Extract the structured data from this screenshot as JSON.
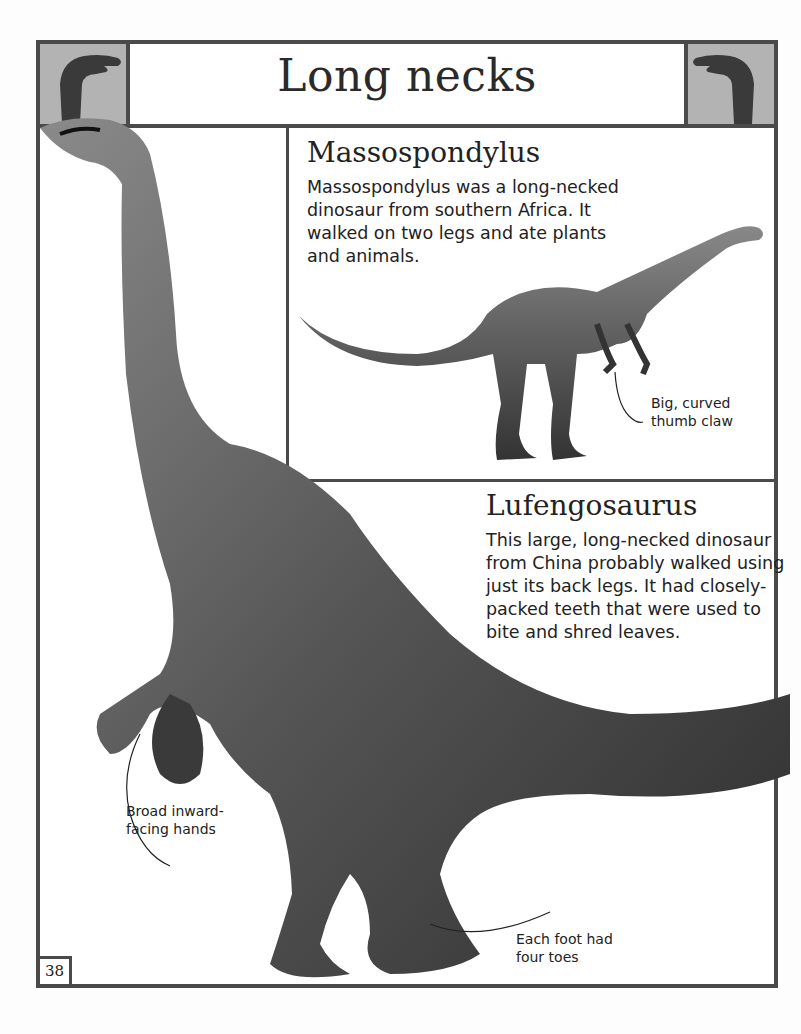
{
  "page": {
    "title": "Long necks",
    "page_number": "38",
    "header_icons": [
      "long-neck-dinosaur-silhouette-left",
      "long-neck-dinosaur-silhouette-right"
    ],
    "colors": {
      "frame": "#4a4a4a",
      "icon_box_bg": "#b3b3b3",
      "silhouette": "#3a3a3a",
      "text": "#222222"
    }
  },
  "sections": {
    "massospondylus": {
      "title": "Massospondylus",
      "text": "Massospondylus was a long-necked dinosaur from southern Africa. It walked on two legs and ate plants and animals.",
      "caption": "Big, curved thumb claw"
    },
    "lufengosaurus": {
      "title": "Lufengosaurus",
      "text": "This large, long-necked dinosaur from China probably walked using just its back legs. It had closely-packed teeth that were used to bite and shred leaves.",
      "captions": {
        "hands": "Broad inward-facing hands",
        "feet": "Each foot had four toes"
      }
    }
  }
}
